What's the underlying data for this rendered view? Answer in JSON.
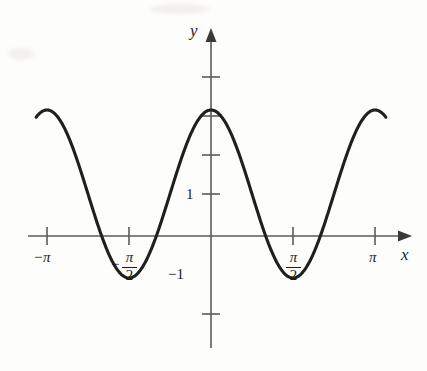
{
  "figure": {
    "background_color": "#fdfdfc",
    "curve_color": "#1f1f1f",
    "axis_color": "#5a5a5a",
    "text_color": "#1b1b1b"
  },
  "axes": {
    "y_axis_label": "y",
    "x_axis_label": "x"
  },
  "labels": {
    "neg_pi": "−π",
    "pi": "π",
    "neg_half_pi_sign": "−",
    "half_pi_numerator": "π",
    "half_pi_denominator": "2",
    "y_one": "1",
    "y_neg_one": "−1"
  },
  "chart_data": {
    "type": "line",
    "title": "",
    "xlabel": "x",
    "ylabel": "y",
    "function": "y = 2cos(2x) + 1",
    "xlim": [
      -3.6,
      3.6
    ],
    "ylim": [
      -2.6,
      4.6
    ],
    "grid": false,
    "legend": null,
    "x_ticks": [
      -3.141592653589793,
      -1.5707963267948966,
      1.5707963267948966,
      3.141592653589793
    ],
    "x_tick_labels": [
      "−π",
      "−π/2",
      "π/2",
      "π"
    ],
    "y_ticks": [
      -2,
      -1,
      1,
      2,
      3,
      4
    ],
    "y_tick_labels": [
      "",
      "−1",
      "1",
      "",
      "",
      ""
    ],
    "amplitude": 2,
    "vertical_shift": 1,
    "period": 3.141592653589793,
    "maximum_value": 3,
    "minimum_value": -1,
    "maxima_at": [
      -1.5707963267948966,
      1.5707963267948966
    ],
    "minima_at": [
      0
    ],
    "x_domain_drawn": [
      -3.35,
      3.35
    ],
    "series": [
      {
        "name": "y = 2cos(2x) + 1",
        "x": [
          -3.35,
          -3.2,
          -3.05,
          -2.9,
          -2.75,
          -2.6,
          -2.45,
          -2.3,
          -2.15,
          -2.0,
          -1.85,
          -1.7,
          -1.5708,
          -1.45,
          -1.3,
          -1.15,
          -1.0,
          -0.85,
          -0.7,
          -0.55,
          -0.4,
          -0.25,
          -0.1,
          0,
          0.1,
          0.25,
          0.4,
          0.55,
          0.7,
          0.85,
          1.0,
          1.15,
          1.3,
          1.45,
          1.5708,
          1.7,
          1.85,
          2.0,
          2.15,
          2.3,
          2.45,
          2.6,
          2.75,
          2.9,
          3.05,
          3.2,
          3.35
        ],
        "y": [
          -0.87,
          -0.44,
          0.2,
          0.97,
          1.78,
          2.5,
          2.92,
          3.0,
          2.72,
          2.14,
          1.35,
          0.5,
          0.0,
          -0.43,
          -0.94,
          -0.99,
          -0.58,
          0.17,
          1.03,
          1.84,
          2.54,
          2.92,
          2.99,
          3.0,
          2.99,
          2.92,
          2.54,
          1.84,
          1.03,
          0.17,
          -0.58,
          -0.99,
          -0.94,
          -0.43,
          0.0,
          0.5,
          1.35,
          2.14,
          2.72,
          3.0,
          2.92,
          2.5,
          1.78,
          0.97,
          0.2,
          -0.44,
          -0.87
        ]
      }
    ]
  }
}
